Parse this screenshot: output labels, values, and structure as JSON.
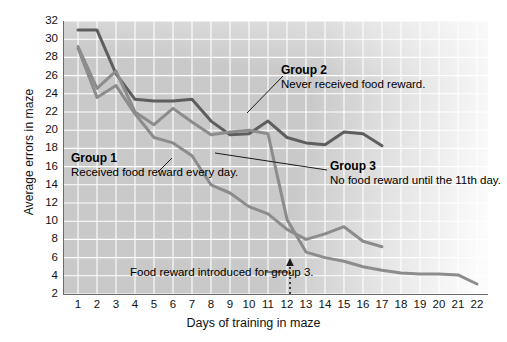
{
  "chart_data": {
    "type": "line",
    "title": "",
    "xlabel": "Days of training in maze",
    "ylabel": "Average errors in maze",
    "xlim": [
      1,
      22
    ],
    "ylim": [
      2,
      32
    ],
    "xticks": [
      1,
      2,
      3,
      4,
      5,
      6,
      7,
      8,
      9,
      10,
      11,
      12,
      13,
      14,
      15,
      16,
      17,
      18,
      19,
      20,
      21,
      22
    ],
    "yticks": [
      2,
      4,
      6,
      8,
      10,
      12,
      14,
      16,
      18,
      20,
      22,
      24,
      26,
      28,
      30,
      32
    ],
    "grid": true,
    "legend": "inline-annotations",
    "series": [
      {
        "name": "Group 1",
        "color": "#8c8c8c",
        "x": [
          1,
          2,
          3,
          4,
          5,
          6,
          7,
          8,
          9,
          10,
          11,
          12,
          13,
          14,
          15,
          16,
          17
        ],
        "values": [
          29.0,
          23.6,
          24.9,
          21.8,
          19.2,
          18.6,
          17.2,
          14.0,
          13.1,
          11.6,
          10.8,
          9.1,
          8.0,
          8.6,
          9.4,
          7.8,
          7.2
        ]
      },
      {
        "name": "Group 2",
        "color": "#5e5e5e",
        "x": [
          1,
          2,
          3,
          4,
          5,
          6,
          7,
          8,
          9,
          10,
          11,
          12,
          13,
          14,
          15,
          16,
          17
        ],
        "values": [
          31.0,
          31.0,
          26.2,
          23.4,
          23.2,
          23.2,
          23.4,
          21.0,
          19.5,
          19.6,
          21.0,
          19.2,
          18.6,
          18.4,
          19.8,
          19.6,
          18.3
        ]
      },
      {
        "name": "Group 3",
        "color": "#8c8c8c",
        "x": [
          1,
          2,
          3,
          4,
          5,
          6,
          7,
          8,
          9,
          10,
          11,
          12,
          13,
          14,
          15,
          16,
          17,
          18,
          19,
          20,
          21,
          22
        ],
        "values": [
          29.2,
          24.6,
          26.5,
          22.0,
          20.6,
          22.4,
          20.9,
          19.5,
          19.8,
          20.0,
          19.6,
          10.2,
          6.6,
          6.0,
          5.6,
          5.0,
          4.6,
          4.3,
          4.2,
          4.2,
          4.1,
          3.1
        ]
      }
    ],
    "annotations": [
      {
        "id": "group1",
        "title": "Group 1",
        "body": "Received food reward every day."
      },
      {
        "id": "group2",
        "title": "Group 2",
        "body": "Never received food reward."
      },
      {
        "id": "group3",
        "title": "Group 3",
        "body": "No food reward until the 11th day."
      },
      {
        "id": "marker",
        "title": "",
        "body": "Food reward introduced for group 3.",
        "at_day": 11
      }
    ]
  },
  "axes": {
    "y_title": "Average errors in maze",
    "x_title": "Days of training in maze"
  },
  "labels": {
    "group1_title": "Group 1",
    "group1_body": "Received food reward every day.",
    "group2_title": "Group 2",
    "group2_body": "Never received food reward.",
    "group3_title": "Group 3",
    "group3_body": "No food reward until the 11th day.",
    "marker_body": "Food reward introduced for group 3."
  }
}
